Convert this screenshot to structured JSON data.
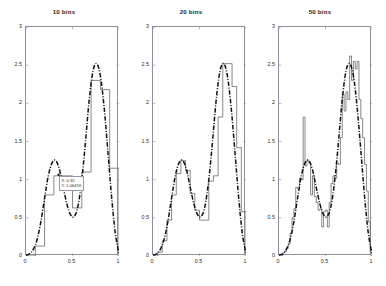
{
  "figure": {
    "background": "#ffffff",
    "axis_color": "#8f8f9a",
    "hist_color": "#555555",
    "curve_color": "#111111",
    "width": 386,
    "height": 286
  },
  "chart_data": [
    {
      "type": "line",
      "title": "10 bins",
      "xlabel": "",
      "ylabel": "",
      "xlim": [
        0,
        1
      ],
      "ylim": [
        0,
        3
      ],
      "xticks": [
        0,
        0.5,
        1
      ],
      "xtick_labels": [
        "0",
        "0.5",
        "1"
      ],
      "yticks": [
        0,
        0.5,
        1,
        1.5,
        2,
        2.5,
        3
      ],
      "ytick_labels": [
        "0",
        "0.5",
        "1",
        "1.5",
        "2",
        "2.5",
        "3"
      ],
      "grid": false,
      "legend": "none",
      "series": [
        {
          "name": "histogram density (10 bins)",
          "style": "stairs",
          "bin_edges": [
            0,
            0.1,
            0.2,
            0.3,
            0.4,
            0.5,
            0.6,
            0.7,
            0.8,
            0.9,
            1.0
          ],
          "values": [
            0.0,
            0.13,
            0.8,
            1.05,
            1.05,
            0.63,
            1.1,
            2.3,
            2.18,
            1.15
          ]
        },
        {
          "name": "true density",
          "style": "dash-dot",
          "x": [
            0.0,
            0.04,
            0.08,
            0.12,
            0.16,
            0.2,
            0.24,
            0.28,
            0.32,
            0.36,
            0.4,
            0.44,
            0.48,
            0.52,
            0.56,
            0.6,
            0.64,
            0.68,
            0.72,
            0.76,
            0.8,
            0.84,
            0.88,
            0.92,
            0.96,
            1.0
          ],
          "y": [
            0.01,
            0.03,
            0.09,
            0.22,
            0.45,
            0.76,
            1.05,
            1.22,
            1.25,
            1.13,
            0.9,
            0.68,
            0.54,
            0.52,
            0.66,
            1.0,
            1.5,
            2.05,
            2.42,
            2.52,
            2.36,
            1.95,
            1.38,
            0.78,
            0.3,
            0.03
          ]
        }
      ],
      "datatip": {
        "x_text": "X: 0.35",
        "y_text": "Y: 1.06459",
        "x_value": 0.35,
        "y_value": 1.06459
      }
    },
    {
      "type": "line",
      "title": "20 bins",
      "xlabel": "",
      "ylabel": "",
      "xlim": [
        0,
        1
      ],
      "ylim": [
        0,
        3
      ],
      "xticks": [
        0,
        0.5,
        1
      ],
      "xtick_labels": [
        "0",
        "0.5",
        "1"
      ],
      "yticks": [
        0,
        0.5,
        1,
        1.5,
        2,
        2.5,
        3
      ],
      "ytick_labels": [
        "0",
        "0.5",
        "1",
        "1.5",
        "2",
        "2.5",
        "3"
      ],
      "grid": false,
      "legend": "none",
      "series": [
        {
          "name": "histogram density (20 bins)",
          "style": "stairs",
          "bin_edges": [
            0,
            0.05,
            0.1,
            0.15,
            0.2,
            0.25,
            0.3,
            0.35,
            0.4,
            0.45,
            0.5,
            0.55,
            0.6,
            0.65,
            0.7,
            0.75,
            0.8,
            0.85,
            0.9,
            0.95,
            1.0
          ],
          "values": [
            0.0,
            0.05,
            0.2,
            0.47,
            0.8,
            1.08,
            1.25,
            1.12,
            0.82,
            0.6,
            0.47,
            0.47,
            0.98,
            1.05,
            1.82,
            2.52,
            2.52,
            2.22,
            1.42,
            0.58
          ]
        },
        {
          "name": "true density",
          "style": "dash-dot",
          "x": [
            0.0,
            0.04,
            0.08,
            0.12,
            0.16,
            0.2,
            0.24,
            0.28,
            0.32,
            0.36,
            0.4,
            0.44,
            0.48,
            0.52,
            0.56,
            0.6,
            0.64,
            0.68,
            0.72,
            0.76,
            0.8,
            0.84,
            0.88,
            0.92,
            0.96,
            1.0
          ],
          "y": [
            0.01,
            0.03,
            0.09,
            0.22,
            0.45,
            0.76,
            1.05,
            1.22,
            1.25,
            1.13,
            0.9,
            0.68,
            0.54,
            0.52,
            0.66,
            1.0,
            1.5,
            2.05,
            2.42,
            2.52,
            2.36,
            1.95,
            1.38,
            0.78,
            0.3,
            0.03
          ]
        }
      ]
    },
    {
      "type": "line",
      "title": "50 bins",
      "xlabel": "",
      "ylabel": "",
      "xlim": [
        0,
        1
      ],
      "ylim": [
        0,
        3
      ],
      "xticks": [
        0,
        0.5,
        1
      ],
      "xtick_labels": [
        "0",
        "0.5",
        "1"
      ],
      "yticks": [
        0,
        0.5,
        1,
        1.5,
        2,
        2.5,
        3
      ],
      "ytick_labels": [
        "0",
        "0.5",
        "1",
        "1.5",
        "2",
        "2.5",
        "3"
      ],
      "grid": false,
      "legend": "none",
      "series": [
        {
          "name": "histogram density (50 bins)",
          "style": "stairs",
          "bin_edges": [
            0.0,
            0.02,
            0.04,
            0.06,
            0.08,
            0.1,
            0.12,
            0.14,
            0.16,
            0.18,
            0.2,
            0.22,
            0.24,
            0.26,
            0.28,
            0.3,
            0.32,
            0.34,
            0.36,
            0.38,
            0.4,
            0.42,
            0.44,
            0.46,
            0.48,
            0.5,
            0.52,
            0.54,
            0.56,
            0.58,
            0.6,
            0.62,
            0.64,
            0.66,
            0.68,
            0.7,
            0.72,
            0.74,
            0.76,
            0.78,
            0.8,
            0.82,
            0.84,
            0.86,
            0.88,
            0.9,
            0.92,
            0.94,
            0.96,
            0.98,
            1.0
          ],
          "values": [
            0.0,
            0.0,
            0.04,
            0.06,
            0.1,
            0.16,
            0.3,
            0.5,
            0.62,
            0.9,
            0.88,
            1.02,
            1.0,
            1.82,
            1.18,
            1.25,
            1.22,
            0.8,
            1.05,
            0.78,
            0.7,
            0.6,
            0.62,
            0.38,
            0.58,
            0.6,
            0.38,
            0.7,
            0.95,
            1.05,
            1.02,
            1.22,
            1.2,
            1.55,
            2.12,
            1.9,
            2.15,
            2.05,
            2.62,
            2.3,
            2.55,
            2.45,
            2.55,
            2.05,
            1.8,
            1.55,
            1.2,
            0.85,
            0.45,
            0.05
          ]
        },
        {
          "name": "true density",
          "style": "dash-dot",
          "x": [
            0.0,
            0.04,
            0.08,
            0.12,
            0.16,
            0.2,
            0.24,
            0.28,
            0.32,
            0.36,
            0.4,
            0.44,
            0.48,
            0.52,
            0.56,
            0.6,
            0.64,
            0.68,
            0.72,
            0.76,
            0.8,
            0.84,
            0.88,
            0.92,
            0.96,
            1.0
          ],
          "y": [
            0.01,
            0.03,
            0.09,
            0.22,
            0.45,
            0.76,
            1.05,
            1.22,
            1.25,
            1.13,
            0.9,
            0.68,
            0.54,
            0.52,
            0.66,
            1.0,
            1.5,
            2.05,
            2.42,
            2.52,
            2.36,
            1.95,
            1.38,
            0.78,
            0.3,
            0.03
          ]
        }
      ]
    }
  ],
  "panels": [
    {
      "title": "10 bins",
      "box": {
        "left": 25,
        "top": 26,
        "width": 93,
        "height": 229
      }
    },
    {
      "title": "20 bins",
      "box": {
        "left": 152,
        "top": 26,
        "width": 93,
        "height": 229
      }
    },
    {
      "title": "50 bins",
      "box": {
        "left": 278,
        "top": 26,
        "width": 93,
        "height": 229
      }
    }
  ]
}
